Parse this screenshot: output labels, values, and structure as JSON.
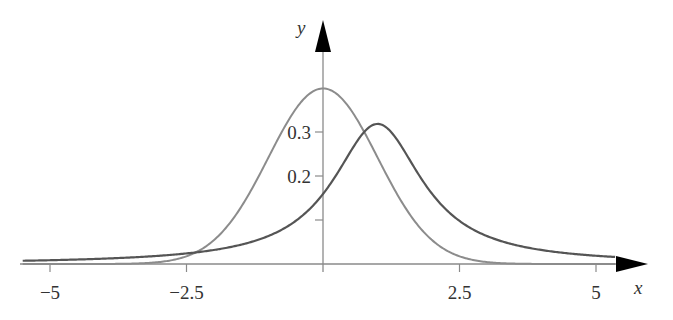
{
  "chart_data": {
    "type": "line",
    "title": "",
    "xlabel": "x",
    "ylabel": "y",
    "xlim": [
      -5.5,
      5.35
    ],
    "ylim": [
      0,
      0.4
    ],
    "grid": false,
    "legend": null,
    "x_ticks": [
      -5,
      -2.5,
      2.5,
      5
    ],
    "x_tick_labels": [
      "−5",
      "−2.5",
      "2.5",
      "5"
    ],
    "y_ticks": [
      0.1,
      0.2,
      0.3
    ],
    "y_tick_labels": [
      "",
      "0.2",
      "0.3"
    ],
    "series": [
      {
        "name": "standard normal density",
        "color": "#8c8c8c",
        "function": "exp(-x^2/2)/sqrt(2*pi)",
        "x": [
          -5.5,
          -3,
          -2.5,
          -2,
          -1.5,
          -1,
          -0.5,
          0,
          0.5,
          1,
          1.5,
          2,
          2.5,
          3,
          5.35
        ],
        "values": [
          0.0,
          0.004,
          0.018,
          0.054,
          0.13,
          0.242,
          0.352,
          0.399,
          0.352,
          0.242,
          0.13,
          0.054,
          0.018,
          0.004,
          0.0
        ]
      },
      {
        "name": "Cauchy density (location 1)",
        "color": "#555555",
        "function": "1/(pi*(1+(x-1)^2))",
        "x": [
          -5.5,
          -4,
          -2.5,
          -1,
          0,
          0.5,
          1,
          1.5,
          2,
          3,
          4,
          5,
          5.35
        ],
        "values": [
          0.007,
          0.012,
          0.024,
          0.064,
          0.159,
          0.255,
          0.318,
          0.255,
          0.159,
          0.064,
          0.032,
          0.019,
          0.016
        ]
      }
    ]
  },
  "axes": {
    "x_label": "x",
    "y_label": "y",
    "x_tick_labels": [
      "−5",
      "−2.5",
      "2.5",
      "5"
    ],
    "y_tick_labels": [
      "0.2",
      "0.3"
    ]
  }
}
